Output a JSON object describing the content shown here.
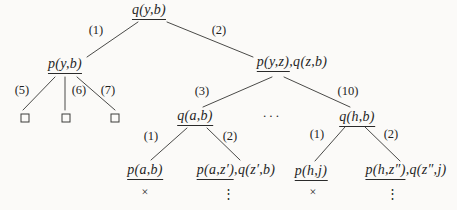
{
  "diagram": {
    "background": "#fbfaf8",
    "text_color": "#1f1f1f",
    "line_color": "#4a4a48",
    "nodes": [
      {
        "id": "root-q-y-b",
        "x": 149,
        "y": 3,
        "parts": [
          {
            "text": "q(y,b)",
            "underline": true
          }
        ]
      },
      {
        "id": "p-y-b",
        "x": 65,
        "y": 57,
        "parts": [
          {
            "text": "p(y,b)",
            "underline": true
          }
        ]
      },
      {
        "id": "p-y-z-q-z-b",
        "x": 292,
        "y": 55,
        "parts": [
          {
            "text": "p(y,z)",
            "underline": true
          },
          {
            "text": ",q(z,b)",
            "underline": false
          }
        ]
      },
      {
        "id": "q-a-b",
        "x": 195,
        "y": 109,
        "parts": [
          {
            "text": "q(a,b)",
            "underline": true
          }
        ]
      },
      {
        "id": "q-h-b",
        "x": 357,
        "y": 110,
        "parts": [
          {
            "text": "q(h,b)",
            "underline": true
          }
        ]
      },
      {
        "id": "p-a-b",
        "x": 145,
        "y": 163,
        "parts": [
          {
            "text": "p(a,b)",
            "underline": true
          }
        ]
      },
      {
        "id": "p-a-z1-q-z1-b",
        "x": 236,
        "y": 163,
        "parts": [
          {
            "text": "p(a,z′)",
            "underline": true
          },
          {
            "text": ",q(z′,b)",
            "underline": false
          }
        ]
      },
      {
        "id": "p-h-j",
        "x": 311,
        "y": 164,
        "parts": [
          {
            "text": "p(h,j)",
            "underline": true
          }
        ]
      },
      {
        "id": "p-h-z2-q-z2-j",
        "x": 406,
        "y": 163,
        "parts": [
          {
            "text": "p(h,z″)",
            "underline": true
          },
          {
            "text": ",q(z″,j)",
            "underline": false
          }
        ]
      }
    ],
    "edges": [
      {
        "label": "(1)",
        "x1": 138,
        "y1": 22,
        "x2": 87,
        "y2": 57,
        "lx": 96,
        "ly": 30
      },
      {
        "label": "(2)",
        "x1": 167,
        "y1": 22,
        "x2": 253,
        "y2": 57,
        "lx": 219,
        "ly": 30
      },
      {
        "label": "(5)",
        "x1": 55,
        "y1": 77,
        "x2": 23,
        "y2": 110,
        "lx": 22,
        "ly": 90
      },
      {
        "label": "(6)",
        "x1": 65,
        "y1": 77,
        "x2": 65,
        "y2": 110,
        "lx": 79,
        "ly": 90
      },
      {
        "label": "(7)",
        "x1": 77,
        "y1": 77,
        "x2": 115,
        "y2": 110,
        "lx": 108,
        "ly": 90
      },
      {
        "label": "(3)",
        "x1": 272,
        "y1": 77,
        "x2": 203,
        "y2": 107,
        "lx": 202,
        "ly": 91
      },
      {
        "label": "(10)",
        "x1": 284,
        "y1": 77,
        "x2": 350,
        "y2": 107,
        "lx": 348,
        "ly": 91
      },
      {
        "label": "(1)",
        "x1": 187,
        "y1": 128,
        "x2": 151,
        "y2": 160,
        "lx": 151,
        "ly": 136
      },
      {
        "label": "(2)",
        "x1": 207,
        "y1": 128,
        "x2": 240,
        "y2": 160,
        "lx": 230,
        "ly": 136
      },
      {
        "label": "(1)",
        "x1": 345,
        "y1": 127,
        "x2": 315,
        "y2": 161,
        "lx": 317,
        "ly": 134
      },
      {
        "label": "(2)",
        "x1": 365,
        "y1": 127,
        "x2": 400,
        "y2": 161,
        "lx": 391,
        "ly": 134
      }
    ],
    "boxes": [
      {
        "x": 25,
        "y": 118
      },
      {
        "x": 66,
        "y": 118
      },
      {
        "x": 115,
        "y": 118
      }
    ],
    "markers": [
      {
        "type": "failure",
        "text": "×",
        "x": 145,
        "y": 192
      },
      {
        "type": "vdots",
        "text": "⋮",
        "x": 228,
        "y": 193
      },
      {
        "type": "failure",
        "text": "×",
        "x": 313,
        "y": 192
      },
      {
        "type": "vdots",
        "text": "⋮",
        "x": 392,
        "y": 193
      }
    ],
    "ellipsis": {
      "text": "···",
      "x": 272,
      "y": 116
    }
  }
}
